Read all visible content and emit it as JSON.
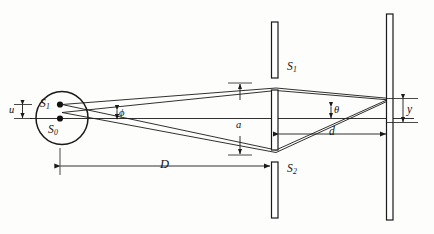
{
  "figure": {
    "kind": "optics-ray-diagram",
    "stroke_color": "#1a1a1a",
    "background_color": "#fdfdfb"
  },
  "source": {
    "shape": "ellipse",
    "points": [
      {
        "name": "source-point-s1",
        "label_base": "S",
        "label_sub": "1"
      },
      {
        "name": "source-point-s0",
        "label_base": "S",
        "label_sub": "0"
      }
    ]
  },
  "slits": {
    "plane_name": "double-slit-barrier",
    "items": [
      {
        "name": "slit-s1",
        "label_base": "S",
        "label_sub": "1"
      },
      {
        "name": "slit-s2",
        "label_base": "S",
        "label_sub": "2"
      }
    ]
  },
  "screen": {
    "name": "observation-screen",
    "label": ""
  },
  "dimensions": [
    {
      "name": "dimension-u",
      "label": "u",
      "orientation": "vertical",
      "meaning": "source separation"
    },
    {
      "name": "dimension-a",
      "label": "a",
      "orientation": "vertical",
      "meaning": "slit separation"
    },
    {
      "name": "dimension-D",
      "label": "D",
      "orientation": "horizontal",
      "meaning": "source to slits distance"
    },
    {
      "name": "dimension-d",
      "label": "d",
      "orientation": "horizontal",
      "meaning": "slits to screen distance"
    },
    {
      "name": "dimension-y",
      "label": "y",
      "orientation": "vertical",
      "meaning": "fringe position on screen"
    }
  ],
  "angles": [
    {
      "name": "angle-phi",
      "label": "ϕ",
      "meaning": "half-angle subtended at source"
    },
    {
      "name": "angle-theta",
      "label": "θ",
      "meaning": "diffraction angle at screen"
    }
  ]
}
